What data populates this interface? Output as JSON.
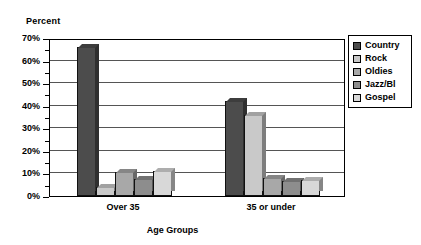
{
  "chart_data": {
    "type": "bar",
    "title": "",
    "subtitle": "",
    "xlabel": "Age Groups",
    "ylabel": "Percent",
    "categories": [
      "Over 35",
      "35 or under"
    ],
    "series": [
      {
        "name": "Country",
        "color": "#4c4c4c",
        "values": [
          66,
          42
        ]
      },
      {
        "name": "Rock",
        "color": "#c9c9c9",
        "values": [
          4,
          36
        ]
      },
      {
        "name": "Oldies",
        "color": "#a8a8a8",
        "values": [
          10.5,
          8
        ]
      },
      {
        "name": "Jazz/Bl",
        "color": "#8d8d8d",
        "values": [
          7.5,
          6.5
        ]
      },
      {
        "name": "Gospel",
        "color": "#d8d8d8",
        "values": [
          11,
          7
        ]
      }
    ],
    "ylim": [
      0,
      70
    ],
    "ytick_labels": [
      "0%",
      "10%",
      "20%",
      "30%",
      "40%",
      "50%",
      "60%",
      "70%"
    ],
    "ytick_values": [
      0,
      10,
      20,
      30,
      40,
      50,
      60,
      70
    ],
    "minor_tick_values": [
      5,
      15,
      25,
      35,
      45,
      55,
      65
    ],
    "grid": true,
    "grid_axis": "y",
    "legend_position": "right",
    "value_suffix": "%"
  },
  "legend": {
    "entries": [
      {
        "label": "Country"
      },
      {
        "label": "Rock"
      },
      {
        "label": "Oldies"
      },
      {
        "label": "Jazz/Bl"
      },
      {
        "label": "Gospel"
      }
    ]
  }
}
